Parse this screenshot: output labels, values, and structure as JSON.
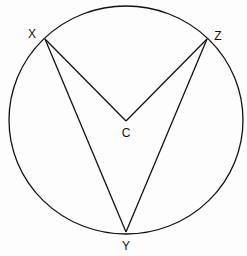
{
  "diagram": {
    "type": "geometry",
    "circle": {
      "center": "C",
      "cx": 126,
      "cy": 120,
      "rx": 117,
      "ry": 114
    },
    "points": [
      {
        "id": "X",
        "label": "X",
        "x": 45,
        "y": 39,
        "label_x": 32,
        "label_y": 34
      },
      {
        "id": "Z",
        "label": "Z",
        "x": 207,
        "y": 39,
        "label_x": 218,
        "label_y": 36
      },
      {
        "id": "C",
        "label": "C",
        "x": 126,
        "y": 121,
        "label_x": 126,
        "label_y": 133
      },
      {
        "id": "Y",
        "label": "Y",
        "x": 126,
        "y": 232,
        "label_x": 126,
        "label_y": 246
      }
    ],
    "segments": [
      [
        "X",
        "C"
      ],
      [
        "C",
        "Z"
      ],
      [
        "X",
        "Y"
      ],
      [
        "Y",
        "Z"
      ]
    ],
    "stroke_color": "#111111"
  }
}
